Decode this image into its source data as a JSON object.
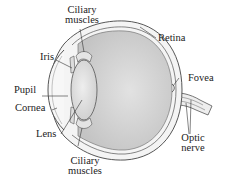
{
  "diagram": {
    "colors": {
      "line": "#444444",
      "sclera_fill": "#f4f4f4",
      "vitreous_fill": "#d8d8d8",
      "lens_fill": "#e6e6e6",
      "text": "#222222"
    },
    "labels": {
      "ciliary_top_line1": "Ciliary",
      "ciliary_top_line2": "muscles",
      "retina": "Retina",
      "iris": "Iris",
      "pupil": "Pupil",
      "fovea": "Fovea",
      "cornea": "Cornea",
      "lens": "Lens",
      "optic_line1": "Optic",
      "optic_line2": "nerve",
      "ciliary_bottom_line1": "Ciliary",
      "ciliary_bottom_line2": "muscles"
    }
  }
}
